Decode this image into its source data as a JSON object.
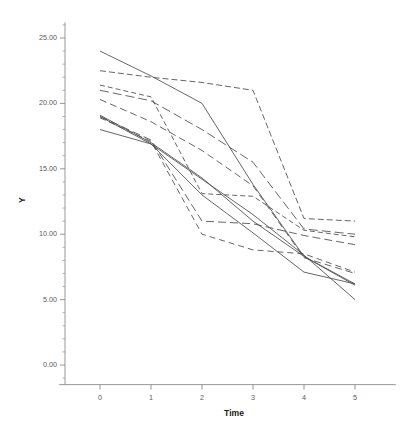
{
  "chart_data": {
    "type": "line",
    "title": "",
    "subtitle": "",
    "xlabel": "Time",
    "ylabel": "Y",
    "x": [
      0,
      1,
      2,
      3,
      4,
      5
    ],
    "xlim": [
      -0.8,
      5.8
    ],
    "ylim": [
      -1.5,
      26.2
    ],
    "xticks": [
      0,
      1,
      2,
      3,
      4,
      5
    ],
    "xtick_labels": [
      "0",
      "1",
      "2",
      "3",
      "4",
      "5"
    ],
    "yticks": [
      0,
      5,
      10,
      15,
      20,
      25
    ],
    "ytick_labels": [
      "0.00",
      "5.00",
      "10.00",
      "15.00",
      "20.00",
      "25.00"
    ],
    "y_minor_tick_step": 1,
    "grid": false,
    "legend": false,
    "legend_position": "none",
    "line_color": "#4a4a4a",
    "background_color": "#ffffff",
    "axis_color": "#8a8a8a",
    "series": [
      {
        "name": "subject-1",
        "style": "solid",
        "dash": "none",
        "values": [
          24.0,
          22.1,
          20.0,
          13.8,
          8.3,
          6.1
        ]
      },
      {
        "name": "subject-2",
        "style": "dashed",
        "dash": "6,3",
        "values": [
          22.5,
          22.0,
          21.6,
          21.0,
          11.2,
          11.0
        ]
      },
      {
        "name": "subject-3",
        "style": "dashed",
        "dash": "5,3",
        "values": [
          21.4,
          20.5,
          13.1,
          12.9,
          10.3,
          9.8
        ]
      },
      {
        "name": "subject-4",
        "style": "dashed",
        "dash": "9,4",
        "values": [
          21.0,
          20.2,
          18.0,
          15.5,
          10.4,
          10.0
        ]
      },
      {
        "name": "subject-5",
        "style": "dashed",
        "dash": "7,4",
        "values": [
          20.3,
          18.6,
          16.4,
          13.7,
          8.2,
          7.0
        ]
      },
      {
        "name": "subject-6",
        "style": "solid",
        "dash": "none",
        "values": [
          19.1,
          17.0,
          14.3,
          11.0,
          8.3,
          6.2
        ]
      },
      {
        "name": "subject-7",
        "style": "solid",
        "dash": "none",
        "values": [
          19.0,
          16.9,
          13.0,
          10.1,
          7.1,
          6.2
        ]
      },
      {
        "name": "subject-8",
        "style": "dashed",
        "dash": "8,4",
        "values": [
          19.0,
          17.2,
          11.0,
          10.8,
          9.9,
          9.2
        ]
      },
      {
        "name": "subject-9",
        "style": "dashed",
        "dash": "6,4",
        "values": [
          18.9,
          17.1,
          10.0,
          8.8,
          8.5,
          7.1
        ]
      },
      {
        "name": "subject-10",
        "style": "solid",
        "dash": "none",
        "values": [
          18.0,
          16.9,
          14.2,
          11.5,
          8.4,
          5.0
        ]
      }
    ]
  },
  "axes": {
    "y_title": "Y",
    "x_title": "Time"
  }
}
